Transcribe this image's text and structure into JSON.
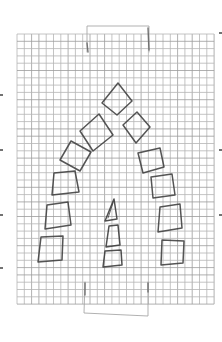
{
  "meta": {
    "width": 222,
    "height": 342,
    "background": "#ffffff"
  },
  "colors": {
    "paper": "#ffffff",
    "grid_line": "#b5b5b5",
    "grid_line_dark": "#9c9c9c",
    "shape_stroke": "#3d3d3d",
    "obelisk_stroke": "#383838",
    "tab_line": "#a3a3a3",
    "tab_accent": "#686868",
    "edge_mark": "#4f4f4f"
  },
  "grid": {
    "x": 17,
    "y": 34,
    "cols": 27,
    "rows": 37,
    "cell": 7.3,
    "line_width": 0.8
  },
  "tab_lines": [
    {
      "name": "top-tab-outline",
      "points": [
        [
          87,
          52
        ],
        [
          87,
          26
        ],
        [
          149,
          26
        ],
        [
          149,
          52
        ]
      ],
      "accent": false
    },
    {
      "name": "top-tab-left-accent",
      "points": [
        [
          87,
          43
        ],
        [
          88,
          52
        ]
      ],
      "accent": true
    },
    {
      "name": "top-tab-right-accent",
      "points": [
        [
          148,
          28
        ],
        [
          149,
          50
        ]
      ],
      "accent": true
    },
    {
      "name": "bottom-tab-outline",
      "points": [
        [
          85,
          282
        ],
        [
          84,
          313
        ],
        [
          148,
          316
        ],
        [
          148,
          282
        ]
      ],
      "accent": false
    },
    {
      "name": "bottom-tab-left-accent",
      "points": [
        [
          85,
          283
        ],
        [
          85,
          295
        ]
      ],
      "accent": true
    },
    {
      "name": "bottom-tab-right-accent",
      "points": [
        [
          148,
          283
        ],
        [
          148,
          292
        ]
      ],
      "accent": true
    }
  ],
  "drawing": {
    "shapes": [
      {
        "name": "arch-square-left-1",
        "type": "polygon",
        "points": [
          [
            41,
            237
          ],
          [
            63,
            236
          ],
          [
            62,
            260
          ],
          [
            38,
            262
          ]
        ]
      },
      {
        "name": "arch-square-left-2",
        "type": "polygon",
        "points": [
          [
            47,
            205
          ],
          [
            68,
            202
          ],
          [
            71,
            225
          ],
          [
            45,
            229
          ]
        ]
      },
      {
        "name": "arch-square-left-3",
        "type": "polygon",
        "points": [
          [
            54,
            173
          ],
          [
            75,
            171
          ],
          [
            79,
            192
          ],
          [
            52,
            195
          ]
        ]
      },
      {
        "name": "arch-square-left-4",
        "type": "polygon",
        "points": [
          [
            71,
            141
          ],
          [
            91,
            152
          ],
          [
            80,
            171
          ],
          [
            60,
            160
          ]
        ]
      },
      {
        "name": "arch-square-left-5",
        "type": "polygon",
        "points": [
          [
            99,
            114
          ],
          [
            113,
            135
          ],
          [
            93,
            151
          ],
          [
            80,
            131
          ]
        ]
      },
      {
        "name": "arch-square-apex",
        "type": "polygon",
        "points": [
          [
            118,
            83
          ],
          [
            132,
            101
          ],
          [
            117,
            115
          ],
          [
            102,
            103
          ]
        ]
      },
      {
        "name": "arch-square-right-1",
        "type": "polygon",
        "points": [
          [
            137,
            112
          ],
          [
            150,
            127
          ],
          [
            136,
            143
          ],
          [
            123,
            125
          ]
        ]
      },
      {
        "name": "arch-square-right-2",
        "type": "polygon",
        "points": [
          [
            138,
            153
          ],
          [
            160,
            148
          ],
          [
            164,
            167
          ],
          [
            143,
            173
          ]
        ]
      },
      {
        "name": "arch-square-right-3",
        "type": "polygon",
        "points": [
          [
            151,
            177
          ],
          [
            172,
            174
          ],
          [
            175,
            195
          ],
          [
            153,
            198
          ]
        ]
      },
      {
        "name": "arch-square-right-4",
        "type": "polygon",
        "points": [
          [
            160,
            207
          ],
          [
            180,
            204
          ],
          [
            182,
            228
          ],
          [
            158,
            232
          ]
        ]
      },
      {
        "name": "arch-square-right-5",
        "type": "polygon",
        "points": [
          [
            162,
            240
          ],
          [
            184,
            241
          ],
          [
            183,
            263
          ],
          [
            161,
            265
          ]
        ]
      },
      {
        "name": "obelisk-top-triangle",
        "type": "polygon",
        "points": [
          [
            114,
            199
          ],
          [
            117,
            219
          ],
          [
            105,
            221
          ]
        ]
      },
      {
        "name": "obelisk-top-inner-line",
        "type": "line",
        "points": [
          [
            113,
            203
          ],
          [
            108,
            218
          ]
        ]
      },
      {
        "name": "obelisk-middle-trapezoid",
        "type": "polygon",
        "points": [
          [
            109,
            226
          ],
          [
            118,
            225
          ],
          [
            120,
            245
          ],
          [
            106,
            247
          ]
        ]
      },
      {
        "name": "obelisk-bottom-block",
        "type": "polygon",
        "points": [
          [
            105,
            251
          ],
          [
            121,
            250
          ],
          [
            122,
            265
          ],
          [
            103,
            267
          ]
        ]
      }
    ]
  },
  "edge_marks": [
    {
      "name": "left-edge-mark-1",
      "x": 0,
      "y": 94,
      "w": 3,
      "h": 2
    },
    {
      "name": "left-edge-mark-2",
      "x": 0,
      "y": 149,
      "w": 3,
      "h": 2
    },
    {
      "name": "left-edge-mark-3",
      "x": 0,
      "y": 214,
      "w": 3,
      "h": 2
    },
    {
      "name": "left-edge-mark-4",
      "x": 0,
      "y": 267,
      "w": 3,
      "h": 2
    },
    {
      "name": "right-edge-mark-1",
      "x": 219,
      "y": 32,
      "w": 3,
      "h": 2
    },
    {
      "name": "right-edge-mark-2",
      "x": 219,
      "y": 149,
      "w": 3,
      "h": 2
    },
    {
      "name": "right-edge-mark-3",
      "x": 219,
      "y": 214,
      "w": 3,
      "h": 2
    }
  ]
}
